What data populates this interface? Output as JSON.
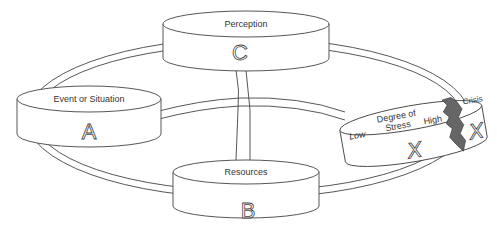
{
  "diagram": {
    "type": "ABC-X model",
    "nodes": {
      "a": {
        "label": "Event or Situation",
        "letter": "A"
      },
      "b": {
        "label": "Resources",
        "letter": "B"
      },
      "c": {
        "label": "Perception",
        "letter": "C"
      },
      "x": {
        "label_line1": "Degree of",
        "label_line2": "Stress",
        "low": "Low",
        "high": "High",
        "letter": "X",
        "crisis_label": "Crisis",
        "crisis_letter": "X"
      }
    },
    "colors": {
      "stroke": "#444444",
      "crack": "#666666",
      "background": "#ffffff"
    }
  }
}
